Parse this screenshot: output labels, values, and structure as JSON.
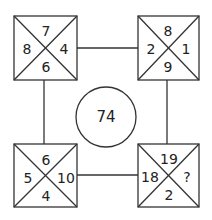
{
  "puzzle": {
    "center_value": "74",
    "boxes": [
      {
        "position": "top-left",
        "top": "7",
        "left": "8",
        "right": "4",
        "bottom": "6"
      },
      {
        "position": "top-right",
        "top": "8",
        "left": "2",
        "right": "1",
        "bottom": "9"
      },
      {
        "position": "bottom-left",
        "top": "6",
        "left": "5",
        "right": "10",
        "bottom": "4"
      },
      {
        "position": "bottom-right",
        "top": "19",
        "left": "18",
        "right": "?",
        "bottom": "2"
      }
    ]
  },
  "colors": {
    "stroke": "#333333",
    "text": "#222222",
    "background": "#ffffff"
  }
}
